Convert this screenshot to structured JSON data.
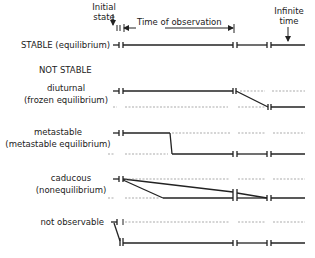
{
  "header": {
    "initial_state_line1": "Initial",
    "initial_state_line2": "state",
    "time_of_observation": "Time of observation",
    "infinite_time_line1": "Infinite",
    "infinite_time_line2": "time"
  },
  "rows": {
    "stable": {
      "label": "STABLE (equilibrium)"
    },
    "not_stable_heading": "NOT STABLE",
    "diurnal": {
      "label_line1": "diuturnal",
      "label_line2": "(frozen equilibrium)"
    },
    "metastable": {
      "label_line1": "metastable",
      "label_line2": "(metastable equilibrium)"
    },
    "caducous": {
      "label_line1": "caducous",
      "label_line2": "(nonequilibrium)"
    },
    "not_observable": {
      "label": "not observable"
    }
  },
  "colors": {
    "line": "#222222",
    "dashed": "#888888",
    "background": "#ffffff"
  }
}
